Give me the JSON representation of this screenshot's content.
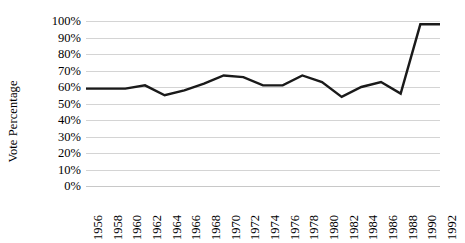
{
  "chart_data": {
    "type": "line",
    "title": "",
    "xlabel": "",
    "ylabel": "Vote Percentage",
    "ylim": [
      0,
      100
    ],
    "ytick_labels": [
      "100%",
      "90%",
      "80%",
      "70%",
      "60%",
      "50%",
      "40%",
      "30%",
      "20%",
      "10%",
      "0%"
    ],
    "ytick_values": [
      100,
      90,
      80,
      70,
      60,
      50,
      40,
      30,
      20,
      10,
      0
    ],
    "grid": true,
    "legend": "none",
    "categories": [
      "1956",
      "1958",
      "1960",
      "1962",
      "1964",
      "1966",
      "1968",
      "1970",
      "1972",
      "1974",
      "1976",
      "1978",
      "1980",
      "1982",
      "1984",
      "1986",
      "1988",
      "1990",
      "1992"
    ],
    "x": [
      1956,
      1958,
      1960,
      1962,
      1964,
      1966,
      1968,
      1970,
      1972,
      1974,
      1976,
      1978,
      1980,
      1982,
      1984,
      1986,
      1988,
      1990,
      1992
    ],
    "values": [
      59,
      59,
      59,
      61,
      55,
      58,
      62,
      67,
      66,
      61,
      61,
      67,
      63,
      54,
      60,
      63,
      56,
      98,
      98
    ],
    "series": [
      {
        "name": "Vote Percentage",
        "color": "#1a1a1a",
        "values": [
          59,
          59,
          59,
          61,
          55,
          58,
          62,
          67,
          66,
          61,
          61,
          67,
          63,
          54,
          60,
          63,
          56,
          98,
          98
        ]
      }
    ],
    "line_color": "#1a1a1a",
    "line_width": 2.4,
    "grid_color": "#d4d4d4",
    "background_color": "#ffffff"
  }
}
